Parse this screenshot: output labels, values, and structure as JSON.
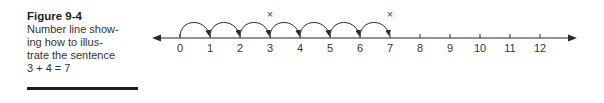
{
  "caption": {
    "title": "Figure 9-4",
    "lines": [
      "Number line show-",
      "ing how to illus-",
      "trate the sentence",
      "3 + 4 = 7"
    ]
  },
  "number_line": {
    "ticks": [
      "0",
      "1",
      "2",
      "3",
      "4",
      "5",
      "6",
      "7",
      "8",
      "9",
      "10",
      "11",
      "12"
    ],
    "hops": [
      [
        0,
        1
      ],
      [
        1,
        2
      ],
      [
        2,
        3
      ],
      [
        3,
        4
      ],
      [
        4,
        5
      ],
      [
        5,
        6
      ],
      [
        6,
        7
      ]
    ],
    "marks": [
      {
        "at": 3,
        "symbol": "×"
      },
      {
        "at": 7,
        "symbol": "×"
      }
    ],
    "colors": {
      "line": "#2a2a2a",
      "text": "#333333"
    }
  }
}
